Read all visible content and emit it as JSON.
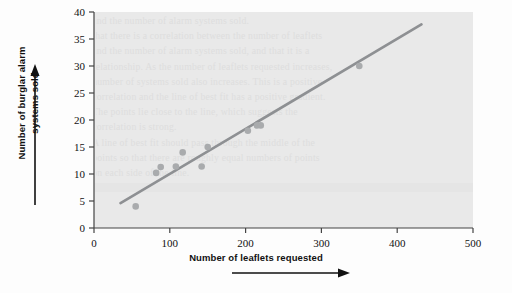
{
  "figure": {
    "kind": "scatter-plot-with-trend-line",
    "background_color": "#fdfdfd",
    "plot_background_color": "#e9e9e9"
  },
  "axes": {
    "x_label": "Number of leaflets requested",
    "y_label_line1": "Number of burglar alarm",
    "y_label_line2": "systems sold",
    "x_arrow_icon": "right-arrow-icon",
    "y_arrow_icon": "up-arrow-icon"
  },
  "ticks": {
    "x": [
      "0",
      "100",
      "200",
      "300",
      "400",
      "500"
    ],
    "y": [
      "0",
      "5",
      "10",
      "15",
      "20",
      "25",
      "30",
      "35",
      "40"
    ]
  },
  "chart_data": {
    "type": "scatter",
    "title": "",
    "xlabel": "Number of leaflets requested",
    "ylabel": "Number of burglar alarm systems sold",
    "xlim": [
      0,
      500
    ],
    "ylim": [
      0,
      40
    ],
    "xticks": [
      0,
      100,
      200,
      300,
      400,
      500
    ],
    "yticks": [
      0,
      5,
      10,
      15,
      20,
      25,
      30,
      35,
      40
    ],
    "grid": false,
    "legend": "none",
    "marker_color": "#a9abad",
    "line_color": "#8e9093",
    "points": [
      {
        "x": 55,
        "y": 4
      },
      {
        "x": 82,
        "y": 10.2
      },
      {
        "x": 88,
        "y": 11.3
      },
      {
        "x": 108,
        "y": 11.4
      },
      {
        "x": 117,
        "y": 14
      },
      {
        "x": 142,
        "y": 11.4
      },
      {
        "x": 150,
        "y": 15
      },
      {
        "x": 203,
        "y": 18
      },
      {
        "x": 215,
        "y": 19
      },
      {
        "x": 220,
        "y": 19
      },
      {
        "x": 350,
        "y": 30
      }
    ],
    "trend_line": {
      "type": "line-of-best-fit",
      "x_start": 35,
      "y_start": 4.6,
      "x_end": 432,
      "y_end": 37.7
    }
  },
  "ghost_text": {
    "note": "faint scanned show-through text behind plot area",
    "lines": [
      "and the number of alarm systems sold.",
      "that there is a correlation between the number of leaflets",
      "and the number of alarm systems sold, and that it is a",
      "relationship. As the number of leaflets requested increases,",
      "number of systems sold also increases. This is a positive",
      "correlation and the line of best fit has a positive gradient.",
      "The points lie close to the line, which suggests the",
      "correlation is strong.",
      "",
      "A line of best fit should pass through the middle of the",
      "points so that there are roughly equal numbers of points",
      "on each side of the line."
    ]
  }
}
